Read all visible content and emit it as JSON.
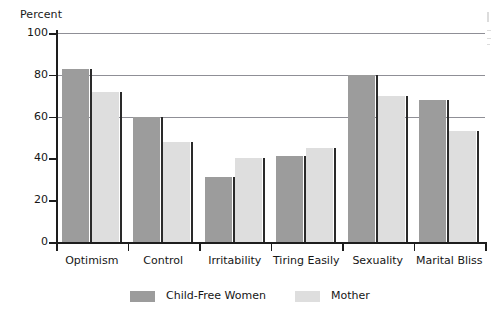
{
  "chart_data": {
    "type": "bar",
    "title": "",
    "xlabel": "",
    "ylabel": "Percent",
    "ylim": [
      0,
      100
    ],
    "yticks": [
      0,
      20,
      40,
      60,
      80,
      100
    ],
    "grid": true,
    "gridlines_at": [
      60,
      80,
      100
    ],
    "legend_position": "bottom",
    "categories": [
      "Optimism",
      "Control",
      "Irritability",
      "Tiring Easily",
      "Sexuality",
      "Marital Bliss"
    ],
    "series": [
      {
        "name": "Child-Free Women",
        "color": "#9c9c9c",
        "values": [
          83,
          60,
          31,
          41,
          80,
          68
        ]
      },
      {
        "name": "Mother",
        "color": "#dedede",
        "values": [
          72,
          48,
          40,
          45,
          70,
          53
        ]
      }
    ]
  },
  "axis": {
    "y_title": "Percent",
    "tick_labels": [
      "100",
      "80",
      "60",
      "40",
      "20",
      "0"
    ]
  },
  "legend": {
    "items": [
      {
        "label": "Child-Free Women"
      },
      {
        "label": "Mother"
      }
    ]
  },
  "colors": {
    "series_dark": "#9c9c9c",
    "series_light": "#dedede",
    "gridline": "#8f8f96",
    "axis": "#1d1d1d",
    "bar_edge": "#2a2a2a",
    "background": "#ffffff"
  }
}
